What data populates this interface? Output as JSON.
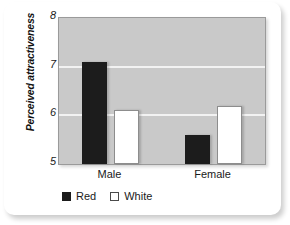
{
  "chart_data": {
    "type": "bar",
    "title": "",
    "xlabel": "",
    "ylabel": "Perceived attractiveness",
    "categories": [
      "Male",
      "Female"
    ],
    "series": [
      {
        "name": "Red",
        "values": [
          7.1,
          5.6
        ]
      },
      {
        "name": "White",
        "values": [
          6.1,
          6.2
        ]
      }
    ],
    "ylim": [
      5,
      8
    ],
    "yticks": [
      5,
      6,
      7,
      8
    ],
    "ytick_labels": [
      "5",
      "6",
      "7",
      "8"
    ],
    "gridlines": [
      6,
      7
    ],
    "grid": true,
    "legend_position": "bottom-left",
    "plot_background": "#c9c9c9",
    "gridline_color": "#f2f2f2",
    "series_colors": {
      "Red": "#1c1c1c",
      "White": "#ffffff"
    }
  },
  "axis": {
    "y_title": "Perceived attractiveness",
    "ticks": [
      {
        "label": "8",
        "value": 8
      },
      {
        "label": "7",
        "value": 7
      },
      {
        "label": "6",
        "value": 6
      },
      {
        "label": "5",
        "value": 5
      }
    ],
    "x_labels": [
      "Male",
      "Female"
    ]
  },
  "legend": {
    "items": [
      {
        "label": "Red",
        "swatch": "filled-square-icon"
      },
      {
        "label": "White",
        "swatch": "outlined-square-icon"
      }
    ]
  }
}
